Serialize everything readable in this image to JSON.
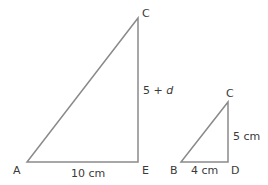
{
  "diagram": {
    "type": "similar-right-triangles",
    "line_color": "#8a8a8a",
    "text_color": "#3a3a3a",
    "large_triangle": {
      "vertices": {
        "A": "A",
        "E": "E",
        "C": "C"
      },
      "base_label": "10 cm",
      "height_label_prefix": "5 + ",
      "height_label_var": "d"
    },
    "small_triangle": {
      "vertices": {
        "B": "B",
        "D": "D",
        "C": "C"
      },
      "base_label": "4 cm",
      "height_label": "5 cm"
    }
  }
}
